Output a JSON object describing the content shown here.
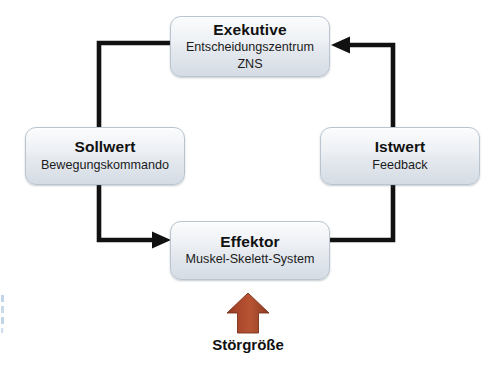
{
  "diagram": {
    "language": "de",
    "colors": {
      "node_border": "#b9c4cf",
      "node_fill_top": "#fbfcfd",
      "node_fill_bottom": "#d5dce4",
      "connector": "#111111",
      "disturbance_arrow": "#a8452a",
      "text": "#111111",
      "background": "#ffffff"
    },
    "nodes": [
      {
        "id": "exekutive",
        "title": "Exekutive",
        "sub_line_1": "Entscheidungszentrum",
        "sub_line_2": "ZNS"
      },
      {
        "id": "sollwert",
        "title": "Sollwert",
        "sub_line_1": "Bewegungskommando",
        "sub_line_2": ""
      },
      {
        "id": "istwert",
        "title": "Istwert",
        "sub_line_1": "Feedback",
        "sub_line_2": ""
      },
      {
        "id": "effektor",
        "title": "Effektor",
        "sub_line_1": "Muskel-Skelett-System",
        "sub_line_2": ""
      }
    ],
    "disturbance": {
      "label": "Störgröße",
      "icon": "up-arrow-icon",
      "color": "#a8452a"
    },
    "connectors": [
      {
        "id": "feedback-to-exekutive",
        "from": "effektor",
        "to": "exekutive",
        "via": "istwert",
        "arrowhead": "left"
      },
      {
        "id": "command-to-effektor",
        "from": "exekutive",
        "to": "effektor",
        "via": "sollwert",
        "arrowhead": "right"
      }
    ]
  }
}
